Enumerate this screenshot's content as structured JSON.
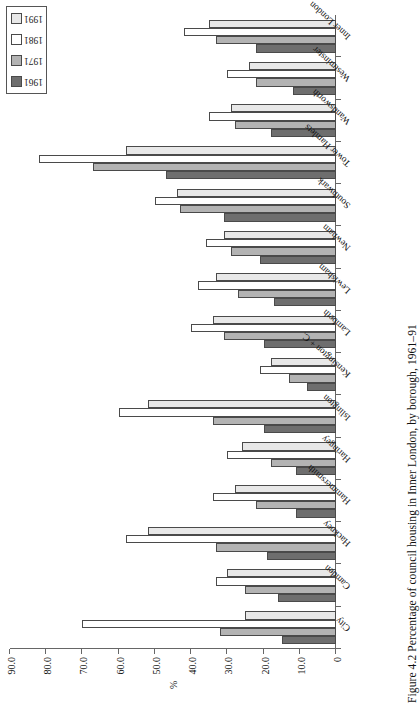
{
  "figure": {
    "caption": "Figure 4.2 Percentage of council housing in Inner London, by borough, 1961–91"
  },
  "legend": {
    "position": "top-right",
    "items": [
      {
        "label": "1961",
        "color": "#6e6e6e"
      },
      {
        "label": "1971",
        "color": "#b3b3b3"
      },
      {
        "label": "1981",
        "color": "#ffffff"
      },
      {
        "label": "1991",
        "color": "#e8e8e8"
      }
    ]
  },
  "chart_data": {
    "type": "bar",
    "title": "",
    "subtitle": "",
    "xlabel": "",
    "ylabel": "%",
    "orientation": "horizontal",
    "grid": false,
    "ylim": [
      0,
      90
    ],
    "tick_labels": [
      "0",
      "10.0",
      "20.0",
      "30.0",
      "40.0",
      "50.0",
      "60.0",
      "70.0",
      "80.0",
      "90.0"
    ],
    "tick_values": [
      0,
      10,
      20,
      30,
      40,
      50,
      60,
      70,
      80,
      90
    ],
    "categories": [
      "City",
      "Camden",
      "Hackney",
      "Hammersmith",
      "Haringey",
      "Islington",
      "Kensington + C.",
      "Lambeth",
      "Lewisham",
      "Newham",
      "Southwark",
      "Tower Hamlets",
      "Wandsworth",
      "Westminster",
      "Inner London"
    ],
    "series": [
      {
        "name": "1961",
        "color": "#6e6e6e",
        "values": [
          15.0,
          16.0,
          19.0,
          11.0,
          11.0,
          20.0,
          8.0,
          20.0,
          17.0,
          21.0,
          31.0,
          47.0,
          18.0,
          12.0,
          22.0
        ]
      },
      {
        "name": "1971",
        "color": "#b3b3b3",
        "values": [
          32.0,
          25.0,
          33.0,
          22.0,
          18.0,
          34.0,
          13.0,
          31.0,
          27.0,
          29.0,
          43.0,
          67.0,
          28.0,
          22.0,
          33.0
        ]
      },
      {
        "name": "1981",
        "color": "#ffffff",
        "values": [
          70.0,
          33.0,
          58.0,
          34.0,
          30.0,
          60.0,
          21.0,
          40.0,
          38.0,
          36.0,
          50.0,
          82.0,
          35.0,
          30.0,
          42.0
        ]
      },
      {
        "name": "1991",
        "color": "#e8e8e8",
        "values": [
          25.0,
          30.0,
          52.0,
          28.0,
          26.0,
          52.0,
          18.0,
          34.0,
          33.0,
          31.0,
          44.0,
          58.0,
          29.0,
          24.0,
          35.0
        ]
      }
    ]
  }
}
